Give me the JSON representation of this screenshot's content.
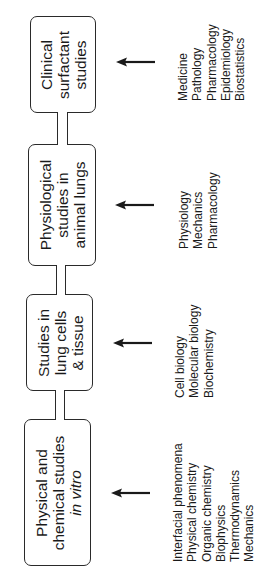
{
  "diagram": {
    "stages": [
      {
        "id": "clinical",
        "label_lines": [
          "Clinical",
          "surfactant",
          "studies"
        ],
        "italic_lines": [],
        "disciplines": [
          "Medicine",
          "Pathology",
          "Pharmacology",
          "Epidemiology",
          "Biostatistics"
        ]
      },
      {
        "id": "physiological",
        "label_lines": [
          "Physiological",
          "studies in",
          "animal lungs"
        ],
        "italic_lines": [],
        "disciplines": [
          "Physiology",
          "Mechanics",
          "Pharmacology"
        ]
      },
      {
        "id": "cells",
        "label_lines": [
          "Studies in",
          "lung cells",
          "& tissue"
        ],
        "italic_lines": [],
        "disciplines": [
          "Cell biology",
          "Molecular biology",
          "Biochemistry"
        ]
      },
      {
        "id": "physical",
        "label_lines": [
          "Physical and",
          "chemical studies",
          "in vitro"
        ],
        "italic_lines": [
          2
        ],
        "disciplines": [
          "Interfacial phenomena",
          "Physical chemistry",
          "Organic chemistry",
          "Biophysics",
          "Thermodynamics",
          "Mechanics"
        ]
      }
    ],
    "arrow_direction": "left",
    "colors": {
      "stroke": "#2a2a2a",
      "text": "#1a1a1a",
      "background": "#ffffff"
    }
  }
}
